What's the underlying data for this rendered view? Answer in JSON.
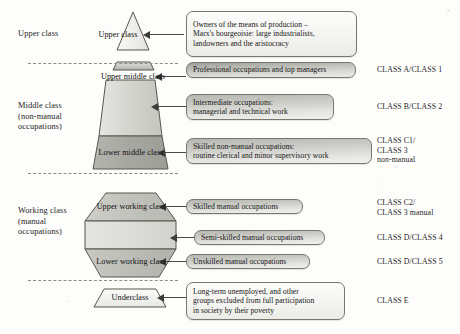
{
  "diagram": {
    "tiers": [
      {
        "id": "upper",
        "label": "Upper class"
      },
      {
        "id": "middle",
        "label": "Middle class\n(non-manual\noccupations)"
      },
      {
        "id": "working",
        "label": "Working class\n(manual\noccupations)"
      }
    ],
    "shapes": [
      {
        "id": "upper-class",
        "label": "Upper class"
      },
      {
        "id": "upper-middle-class",
        "label": "Upper middle class"
      },
      {
        "id": "lower-middle-class",
        "label": "Lower middle class"
      },
      {
        "id": "upper-working-class",
        "label": "Upper working class"
      },
      {
        "id": "lower-working-class",
        "label": "Lower working class"
      },
      {
        "id": "underclass",
        "label": "Underclass"
      }
    ],
    "callouts": [
      {
        "id": "owners",
        "text": "Owners of the means of production –\nMarx's bourgeoisie: large industrialists,\nlandowners and the aristocracy",
        "style": "plain"
      },
      {
        "id": "professional",
        "text": "Professional occupations and top managers",
        "style": "shaded"
      },
      {
        "id": "intermediate",
        "text": "Intermediate occupations:\nmanagerial and technical work",
        "style": "shaded-light"
      },
      {
        "id": "skilled-non-manual",
        "text": "Skilled non-manual occupations:\nroutine clerical and minor supervisory work",
        "style": "shaded-light"
      },
      {
        "id": "skilled-manual",
        "text": "Skilled manual occupations",
        "style": "shaded-light"
      },
      {
        "id": "semi-skilled-manual",
        "text": "Semi-skilled manual occupations",
        "style": "shaded-light"
      },
      {
        "id": "unskilled-manual",
        "text": "Unskilled manual occupations",
        "style": "shaded-light"
      },
      {
        "id": "underclass-desc",
        "text": "Long-term unemployed, and other\ngroups excluded from full participation\nin society by their poverty",
        "style": "plain"
      }
    ],
    "class_codes": [
      {
        "id": "class-a",
        "text": "CLASS A/CLASS 1"
      },
      {
        "id": "class-b",
        "text": "CLASS B/CLASS 2"
      },
      {
        "id": "class-c1",
        "text": "CLASS C1/\nCLASS 3\nnon-manual"
      },
      {
        "id": "class-c2",
        "text": "CLASS C2/\nCLASS 3 manual"
      },
      {
        "id": "class-d4",
        "text": "CLASS D/CLASS 4"
      },
      {
        "id": "class-d5",
        "text": "CLASS D/CLASS 5"
      },
      {
        "id": "class-e",
        "text": "CLASS E"
      }
    ],
    "colors": {
      "outline": "#595953",
      "fill_light": "#f2f2ef",
      "fill_mid": "#cfcfca",
      "fill_dark": "#a6a6a0",
      "divider": "#8d8d84",
      "arrow": "#3c3c39"
    }
  }
}
